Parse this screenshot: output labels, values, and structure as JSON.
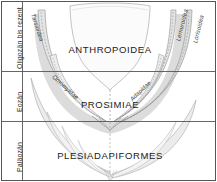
{
  "figure": {
    "kind": "primate-phylogeny-stratigraphic-chart",
    "language": "de",
    "background_color": "#ffffff",
    "band_fill": "#d8d8d8",
    "band_fill_light": "#ececec",
    "line_color": "#9a9a9a",
    "axis_color": "#4a4a4a",
    "text_color": "#1a1a1a"
  },
  "time_axis": {
    "label": "geologische Zeitskala",
    "epochs": [
      {
        "id": "oligozaen",
        "label": "Oligozän bis rezent"
      },
      {
        "id": "eozaen",
        "label": "Eozän"
      },
      {
        "id": "palaeozaen",
        "label": "Paläozän"
      }
    ]
  },
  "clades": [
    {
      "id": "anthropoidea",
      "label": "ANTHROPOIDEA"
    },
    {
      "id": "prosimiae",
      "label": "PROSIMIAE"
    },
    {
      "id": "plesiadapiformes",
      "label": "PLESIADAPIFORMES"
    }
  ],
  "lineages": [
    {
      "id": "tarsioidea",
      "label": "Tarsioidea"
    },
    {
      "id": "omomyidae",
      "label": "Omomyidae"
    },
    {
      "id": "adapidae",
      "label": "Adapidae"
    },
    {
      "id": "lemuroidea",
      "label": "Lemuroidea"
    },
    {
      "id": "lorisoidea",
      "label": "Lorisoidea"
    }
  ]
}
